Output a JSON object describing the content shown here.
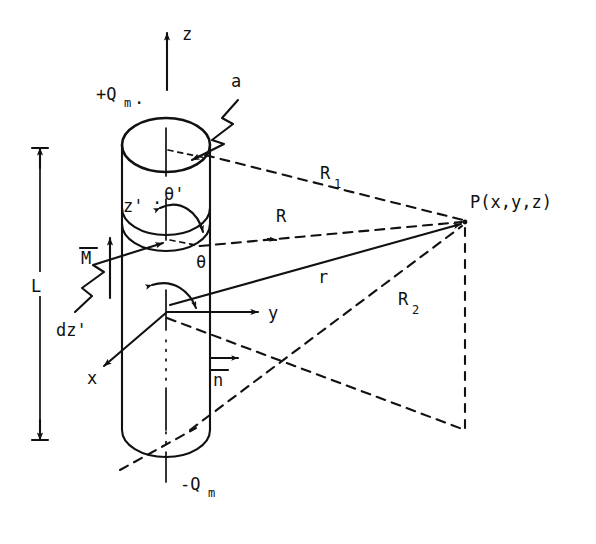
{
  "figure": {
    "kind": "physics-diagram",
    "background_color": "#ffffff",
    "ink_color": "#111111"
  },
  "labels": {
    "axis_z": "z",
    "axis_y": "y",
    "axis_x": "x",
    "pole_top": "+Q",
    "pole_top_sub": "m",
    "pole_top_trailing": ".",
    "pole_bottom": "-Q",
    "pole_bottom_sub": "m",
    "radius": "a",
    "length": "L",
    "magnetization": "M",
    "normal": "n",
    "source_element": "dz'",
    "source_axis": "z'",
    "source_angle": "θ'",
    "field_angle": "θ",
    "dist_top": "R",
    "dist_top_sub": "1",
    "dist_bottom": "R",
    "dist_bottom_sub": "2",
    "dist_element": "R",
    "dist_origin": "r",
    "field_point": "P(x,y,z)"
  },
  "geometry": {
    "cylinder": {
      "center_x": 166,
      "radius_x": 44,
      "ellipse_ry": 27,
      "top_y": 145,
      "bottom_y": 452
    },
    "origin": {
      "x": 167,
      "y": 312
    },
    "field_point": {
      "x": 465,
      "y": 222
    },
    "element_point": {
      "x": 166,
      "y": 240
    },
    "dimension_line": {
      "x": 40,
      "y_top": 148,
      "y_bottom": 440
    }
  }
}
